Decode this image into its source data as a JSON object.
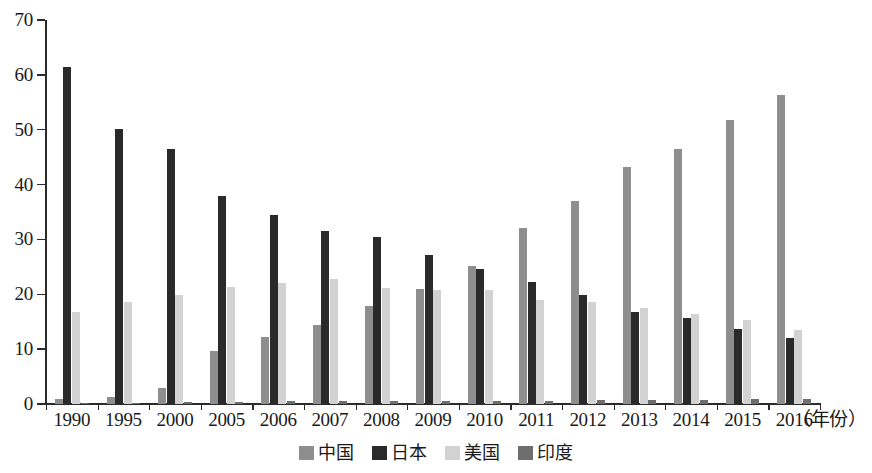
{
  "chart_data": {
    "type": "bar",
    "title": "",
    "subtitle": "",
    "xlabel": "（年份）",
    "ylabel": "",
    "ylim": [
      0,
      70
    ],
    "ytick_step": 10,
    "yticks": [
      70,
      60,
      50,
      40,
      30,
      20,
      10,
      0
    ],
    "grid": false,
    "legend_position": "bottom-center",
    "categories": [
      "1990",
      "1995",
      "2000",
      "2005",
      "2006",
      "2007",
      "2008",
      "2009",
      "2010",
      "2011",
      "2012",
      "2013",
      "2014",
      "2015",
      "2016"
    ],
    "series": [
      {
        "name": "中国",
        "color": "#8e8e8e",
        "values": [
          1.0,
          1.2,
          2.9,
          9.6,
          12.2,
          14.4,
          17.8,
          21.0,
          25.1,
          32.0,
          37.0,
          43.2,
          46.5,
          51.8,
          56.3
        ]
      },
      {
        "name": "日本",
        "color": "#2a2a2a",
        "values": [
          61.5,
          50.2,
          46.5,
          38.0,
          34.5,
          31.5,
          30.4,
          27.2,
          24.7,
          22.2,
          19.8,
          16.7,
          15.6,
          13.7,
          12.1
        ]
      },
      {
        "name": "美国",
        "color": "#d2d2d2",
        "values": [
          16.7,
          18.6,
          19.8,
          21.4,
          22.1,
          22.7,
          21.2,
          20.7,
          20.7,
          18.9,
          18.6,
          17.5,
          16.4,
          15.3,
          13.5
        ]
      },
      {
        "name": "印度",
        "color": "#6e6e6e",
        "values": [
          0.2,
          0.2,
          0.3,
          0.4,
          0.5,
          0.5,
          0.5,
          0.6,
          0.6,
          0.6,
          0.8,
          0.8,
          0.8,
          0.9,
          0.9
        ]
      }
    ]
  },
  "axis": {
    "x_title": "（年份）",
    "y_tick_labels": [
      "70",
      "60",
      "50",
      "40",
      "30",
      "20",
      "10",
      "0"
    ]
  },
  "legend": {
    "items": [
      {
        "label": "中国",
        "color": "#8e8e8e"
      },
      {
        "label": "日本",
        "color": "#2a2a2a"
      },
      {
        "label": "美国",
        "color": "#d2d2d2"
      },
      {
        "label": "印度",
        "color": "#6e6e6e"
      }
    ]
  }
}
